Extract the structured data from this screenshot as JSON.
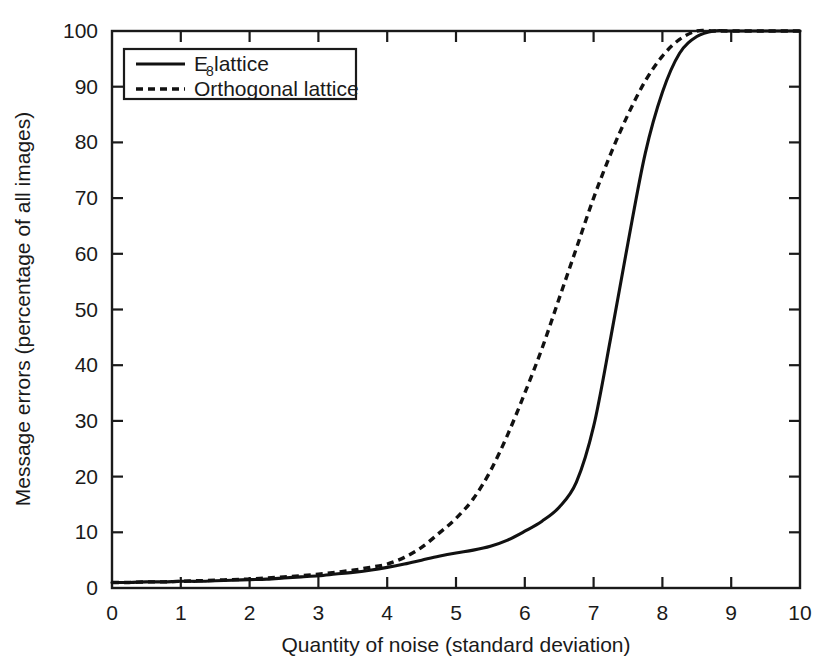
{
  "chart_data": {
    "type": "line",
    "title": "",
    "xlabel": "Quantity of noise (standard deviation)",
    "ylabel": "Message errors (percentage of all images)",
    "xlim": [
      0,
      10
    ],
    "ylim": [
      0,
      100
    ],
    "xticks": [
      "0",
      "1",
      "2",
      "3",
      "4",
      "5",
      "6",
      "7",
      "8",
      "9",
      "10"
    ],
    "yticks": [
      "0",
      "10",
      "20",
      "30",
      "40",
      "50",
      "60",
      "70",
      "80",
      "90",
      "100"
    ],
    "grid": false,
    "legend_position": "top-left",
    "legend_entries": [
      {
        "label": "E8 lattice",
        "label_main": "E",
        "label_sub": "8",
        "label_rest": " lattice",
        "style": "solid"
      },
      {
        "label": "Orthogonal lattice",
        "label_main": "Orthogonal lattice",
        "label_sub": "",
        "label_rest": "",
        "style": "dashed"
      }
    ],
    "series": [
      {
        "name": "E8 lattice",
        "style": "solid",
        "x": [
          0,
          0.25,
          0.5,
          0.75,
          1.0,
          1.25,
          1.5,
          1.75,
          2.0,
          2.25,
          2.5,
          2.75,
          3.0,
          3.25,
          3.5,
          3.75,
          4.0,
          4.25,
          4.5,
          4.75,
          5.0,
          5.25,
          5.5,
          5.75,
          6.0,
          6.25,
          6.5,
          6.75,
          7.0,
          7.25,
          7.5,
          7.75,
          8.0,
          8.25,
          8.5,
          8.75,
          9.0,
          9.5,
          10.0
        ],
        "y": [
          1.0,
          1.0,
          1.1,
          1.1,
          1.2,
          1.2,
          1.3,
          1.4,
          1.5,
          1.6,
          1.8,
          2.0,
          2.2,
          2.5,
          2.8,
          3.2,
          3.7,
          4.3,
          5.0,
          5.7,
          6.3,
          6.8,
          7.5,
          8.6,
          10.2,
          12.0,
          14.5,
          19.0,
          29.0,
          45.0,
          62.0,
          78.0,
          89.0,
          96.0,
          99.0,
          100.0,
          100.0,
          100.0,
          100.0
        ]
      },
      {
        "name": "Orthogonal lattice",
        "style": "dashed",
        "x": [
          0,
          0.25,
          0.5,
          0.75,
          1.0,
          1.25,
          1.5,
          1.75,
          2.0,
          2.25,
          2.5,
          2.75,
          3.0,
          3.25,
          3.5,
          3.75,
          4.0,
          4.25,
          4.5,
          4.75,
          5.0,
          5.25,
          5.5,
          5.75,
          6.0,
          6.25,
          6.5,
          6.75,
          7.0,
          7.25,
          7.5,
          7.75,
          8.0,
          8.25,
          8.5,
          8.75,
          9.0,
          9.5,
          10.0
        ],
        "y": [
          1.0,
          1.0,
          1.1,
          1.1,
          1.2,
          1.3,
          1.4,
          1.5,
          1.6,
          1.8,
          2.0,
          2.2,
          2.5,
          2.8,
          3.2,
          3.7,
          4.3,
          5.5,
          7.3,
          9.8,
          12.5,
          16.0,
          21.0,
          27.5,
          35.0,
          43.0,
          52.0,
          61.0,
          70.0,
          78.0,
          85.0,
          91.0,
          95.5,
          98.5,
          100.0,
          100.0,
          100.0,
          100.0,
          100.0
        ]
      }
    ]
  },
  "colors": {
    "background": "#ffffff",
    "ink": "#1a1a1a",
    "series": "#111111"
  }
}
